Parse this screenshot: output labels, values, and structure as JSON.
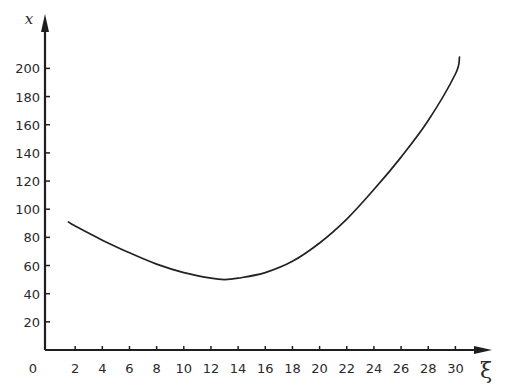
{
  "chart_data": {
    "type": "line",
    "title": "",
    "xlabel": "ξ",
    "ylabel": "x",
    "origin_label": "0",
    "xlim": [
      0,
      32
    ],
    "ylim": [
      0,
      215
    ],
    "xticks": [
      2,
      4,
      6,
      8,
      10,
      12,
      14,
      16,
      18,
      20,
      22,
      24,
      26,
      28,
      30
    ],
    "yticks": [
      20,
      40,
      60,
      80,
      100,
      120,
      140,
      160,
      180,
      200
    ],
    "grid": false,
    "legend": null,
    "series": [
      {
        "name": "x(ξ)",
        "color": "#222222",
        "x": [
          1.5,
          2,
          4,
          6,
          8,
          10,
          12,
          13,
          14,
          16,
          18,
          20,
          22,
          24,
          26,
          28,
          30,
          30.3
        ],
        "y": [
          91,
          88,
          78,
          69,
          61,
          55,
          51,
          50,
          51,
          55,
          63,
          76,
          93,
          114,
          137,
          163,
          196,
          208
        ]
      }
    ]
  }
}
